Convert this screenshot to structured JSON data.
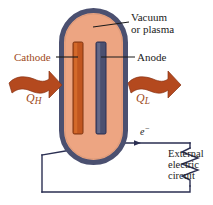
{
  "figure": {
    "colors": {
      "vessel_wall": "#4B5070",
      "vessel_interior": "#EDA582",
      "cathode_rod": "#C1561F",
      "anode_rod": "#4B5070",
      "heat_arrow": "#B4491E",
      "label_accent": "#9E4A20",
      "wire": "#2B2F52",
      "text": "#1a1a1a",
      "background": "#ffffff"
    }
  },
  "labels": {
    "vacuum_line1": "Vacuum",
    "vacuum_line2": "or plasma",
    "cathode": "Cathode",
    "anode": "Anode",
    "heat_in_symbol": "Q",
    "heat_in_subscript": "H",
    "heat_out_symbol": "Q",
    "heat_out_subscript": "L",
    "electron_symbol": "e",
    "electron_superscript": "−",
    "external_line1": "External",
    "external_line2": "electric",
    "external_line3": "circuit"
  },
  "components": {
    "vessel": "capsule-vessel",
    "cathode_rod": "cathode-rod",
    "anode_rod": "anode-rod",
    "heat_in_arrow": "heat-in-arrow",
    "heat_out_arrow": "heat-out-arrow",
    "resistor": "external-circuit-resistor",
    "electron_flow_arrow": "electron-flow-arrow"
  }
}
